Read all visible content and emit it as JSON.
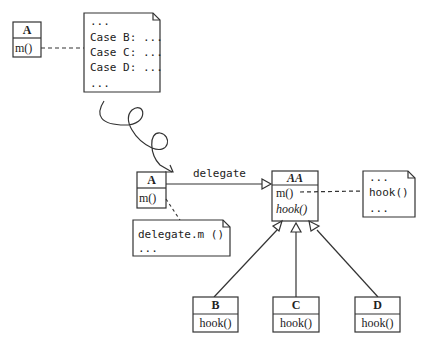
{
  "colors": {
    "stroke": "#333333",
    "background": "#ffffff",
    "text": "#222222"
  },
  "top": {
    "class_a": {
      "name": "A",
      "method": "m()"
    },
    "note": {
      "lines": [
        "...",
        "Case B: ...",
        "Case C: ...",
        "Case D: ...",
        " ..."
      ]
    }
  },
  "bottom": {
    "class_a": {
      "name": "A",
      "method": "m()"
    },
    "association_label": "delegate",
    "note_a": {
      "lines": [
        "delegate.m ()",
        "..."
      ]
    },
    "abstract_class": {
      "name": "AA",
      "methods": [
        "m()",
        "hook()"
      ]
    },
    "note_aa": {
      "lines": [
        "...",
        "hook()",
        "..."
      ]
    },
    "subclasses": [
      {
        "name": "B",
        "method": "hook()"
      },
      {
        "name": "C",
        "method": "hook()"
      },
      {
        "name": "D",
        "method": "hook()"
      }
    ]
  }
}
